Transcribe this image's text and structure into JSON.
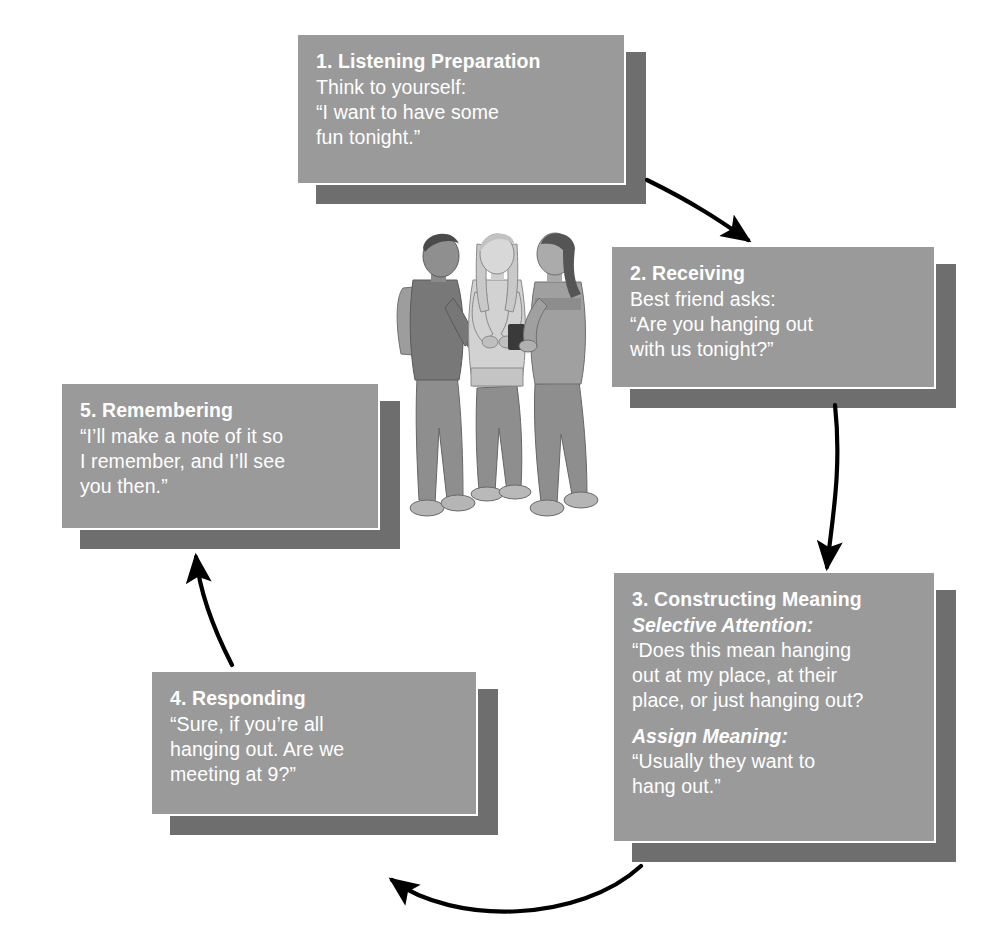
{
  "diagram": {
    "type": "cycle-flow",
    "background_color": "#ffffff",
    "box_fill_color": "#9a9a9a",
    "box_shadow_color": "#6e6e6e",
    "box_border_color": "#ffffff",
    "text_color": "#ffffff",
    "arrow_color": "#000000"
  },
  "steps": [
    {
      "id": "step-1",
      "title": "1. Listening Preparation",
      "lines": [
        "Think to yourself:",
        "“I want to have some",
        "fun tonight.”"
      ]
    },
    {
      "id": "step-2",
      "title": "2. Receiving",
      "lines": [
        "Best friend asks:",
        "“Are you hanging out",
        "with us tonight?”"
      ]
    },
    {
      "id": "step-3",
      "title": "3. Constructing Meaning",
      "sublabel_1": "Selective Attention:",
      "lines_1": [
        "“Does this mean hanging",
        "out at my place, at their",
        "place, or just hanging out?"
      ],
      "sublabel_2": "Assign Meaning:",
      "lines_2": [
        "“Usually they want to",
        "hang out.”"
      ]
    },
    {
      "id": "step-4",
      "title": "4. Responding",
      "lines": [
        "“Sure, if you’re all",
        "hanging out. Are we",
        "meeting at 9?”"
      ]
    },
    {
      "id": "step-5",
      "title": "5. Remembering",
      "lines": [
        "“I’ll make a note of it so",
        "I remember, and I’ll see",
        "you then.”"
      ]
    }
  ],
  "arrows": [
    {
      "id": "arrow-1-to-2",
      "from": "step-1",
      "to": "step-2"
    },
    {
      "id": "arrow-2-to-3",
      "from": "step-2",
      "to": "step-3"
    },
    {
      "id": "arrow-3-to-4",
      "from": "step-3",
      "to": "step-4"
    },
    {
      "id": "arrow-4-to-5",
      "from": "step-4",
      "to": "step-5"
    }
  ],
  "illustration": {
    "id": "three-teens-talking",
    "description": "Three teenagers standing and talking; one wears a backpack, one holds a mobile phone"
  }
}
